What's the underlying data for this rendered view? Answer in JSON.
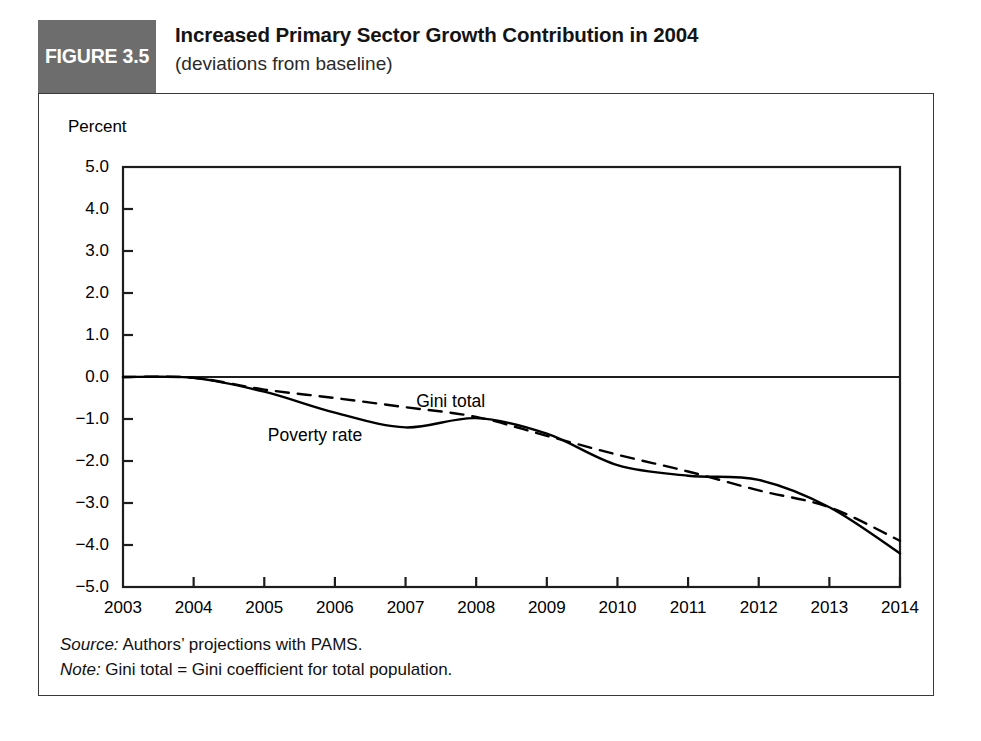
{
  "figure": {
    "badge_label": "FIGURE 3.5",
    "title": "Increased Primary Sector Growth Contribution in 2004",
    "subtitle": "(deviations from baseline)"
  },
  "notes": {
    "source_keyword": "Source:",
    "source_text": " Authors’ projections with PAMS.",
    "note_keyword": "Note:",
    "note_text": " Gini total = Gini coefficient for total population."
  },
  "chart_data": {
    "type": "line",
    "title": "Increased Primary Sector Growth Contribution in 2004",
    "subtitle": "(deviations from baseline)",
    "xlabel": "",
    "ylabel": "Percent",
    "ylim": [
      -5.0,
      5.0
    ],
    "xlim": [
      2003,
      2014
    ],
    "grid": false,
    "legend_position": "inline-annotation",
    "y_ticks": [
      "5.0",
      "4.0",
      "3.0",
      "2.0",
      "1.0",
      "0.0",
      "−1.0",
      "−2.0",
      "−3.0",
      "−4.0",
      "−5.0"
    ],
    "y_tick_values": [
      5.0,
      4.0,
      3.0,
      2.0,
      1.0,
      0.0,
      -1.0,
      -2.0,
      -3.0,
      -4.0,
      -5.0
    ],
    "x_ticks": [
      "2003",
      "2004",
      "2005",
      "2006",
      "2007",
      "2008",
      "2009",
      "2010",
      "2011",
      "2012",
      "2013",
      "2014"
    ],
    "x": [
      2003,
      2004,
      2005,
      2006,
      2007,
      2008,
      2009,
      2010,
      2011,
      2012,
      2013,
      2014
    ],
    "zero_line": 0.0,
    "series": [
      {
        "name": "Poverty rate",
        "style": "solid",
        "color": "#000000",
        "label_x": 2005.05,
        "label_y": -1.52,
        "values": [
          0.0,
          -0.02,
          -0.35,
          -0.85,
          -1.2,
          -0.98,
          -1.35,
          -2.1,
          -2.35,
          -2.45,
          -3.1,
          -4.2
        ]
      },
      {
        "name": "Gini total",
        "style": "dashed",
        "color": "#000000",
        "label_x": 2007.15,
        "label_y": -0.72,
        "values": [
          0.0,
          -0.02,
          -0.3,
          -0.5,
          -0.72,
          -0.95,
          -1.4,
          -1.85,
          -2.25,
          -2.7,
          -3.1,
          -3.9
        ]
      }
    ]
  }
}
